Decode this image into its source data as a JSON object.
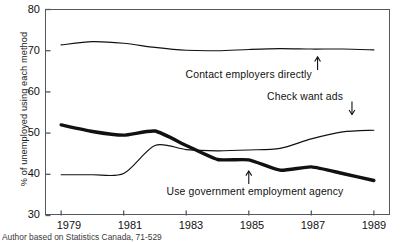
{
  "chart_data": {
    "type": "line",
    "title": "",
    "xlabel": "",
    "ylabel": "% of unemployed using each method",
    "xlim": [
      1978.5,
      1989.5
    ],
    "ylim": [
      30,
      80
    ],
    "ytick_values": [
      80,
      70,
      60,
      50,
      40,
      30
    ],
    "ytick_labels": [
      "80",
      "70",
      "60",
      "50",
      "40",
      "30"
    ],
    "xtick_values": [
      1979,
      1981,
      1983,
      1985,
      1987,
      1989
    ],
    "xtick_labels": [
      "1979",
      "1981",
      "1983",
      "1985",
      "1987",
      "1989"
    ],
    "grid": false,
    "legend_position": "inline-annotations",
    "x": [
      1979,
      1980,
      1981,
      1982,
      1983,
      1984,
      1985,
      1986,
      1987,
      1988,
      1989
    ],
    "series": [
      {
        "name": "Contact employers directly",
        "style": "thin",
        "values": [
          71.4,
          72.2,
          71.8,
          70.8,
          70.1,
          70.0,
          70.3,
          70.5,
          70.4,
          70.4,
          70.2
        ]
      },
      {
        "name": "Check want ads",
        "style": "thin",
        "values": [
          39.9,
          39.9,
          40.2,
          47.0,
          46.0,
          45.7,
          45.9,
          46.3,
          48.6,
          50.3,
          50.7
        ]
      },
      {
        "name": "Use government employment agency",
        "style": "thick",
        "values": [
          52.0,
          50.4,
          49.5,
          50.5,
          47.0,
          43.6,
          43.5,
          41.0,
          41.8,
          40.2,
          38.5
        ]
      }
    ],
    "annotations": [
      {
        "id": "contact-employers",
        "label": "Contact employers directly",
        "arrow": "up",
        "arrow_x": 1987.2,
        "arrow_y_value": 68.5,
        "text_x": 1985.0,
        "text_y_value": 64.0
      },
      {
        "id": "check-want-ads",
        "label": "Check want ads",
        "arrow": "down",
        "arrow_x": 1988.3,
        "arrow_y_value": 54.5,
        "text_x": 1986.8,
        "text_y_value": 58.8
      },
      {
        "id": "use-government-agency",
        "label": "Use government employment agency",
        "arrow": "up",
        "arrow_x": 1985.0,
        "arrow_y_value": 40.8,
        "text_x": 1985.2,
        "text_y_value": 35.6
      }
    ],
    "colors": {
      "line": "#111111",
      "axis": "#55585c",
      "background": "#ffffff"
    }
  },
  "source": {
    "note": "Author based on Statistics Canada, 71-529"
  }
}
